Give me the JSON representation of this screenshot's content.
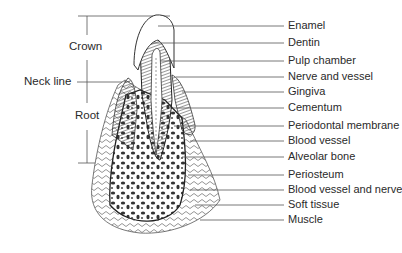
{
  "figure": {
    "left_labels": [
      {
        "text": "Crown",
        "y": 47
      },
      {
        "text": "Neck line",
        "y": 82
      },
      {
        "text": "Root",
        "y": 116
      }
    ],
    "right_labels": [
      {
        "text": "Enamel",
        "y": 26
      },
      {
        "text": "Dentin",
        "y": 43
      },
      {
        "text": "Pulp chamber",
        "y": 61
      },
      {
        "text": "Nerve and vessel",
        "y": 77
      },
      {
        "text": "Gingiva",
        "y": 92
      },
      {
        "text": "Cementum",
        "y": 108
      },
      {
        "text": "Periodontal membrane",
        "y": 126
      },
      {
        "text": "Blood vessel",
        "y": 141
      },
      {
        "text": "Alveolar bone",
        "y": 157
      },
      {
        "text": "Periosteum",
        "y": 175
      },
      {
        "text": "Blood vessel and nerve",
        "y": 190
      },
      {
        "text": "Soft tissue",
        "y": 205
      },
      {
        "text": "Muscle",
        "y": 220
      }
    ],
    "line_color": "#555555",
    "ink_color": "#2a2a2a"
  }
}
